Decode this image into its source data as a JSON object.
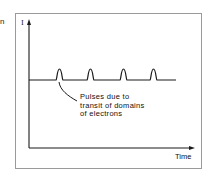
{
  "fragment_text": "n",
  "diagram": {
    "y_axis_label": "I",
    "x_axis_label": "Time",
    "annotation": {
      "lines": [
        "Pulses due to",
        "transit of domains",
        "of electrons"
      ]
    },
    "signal": {
      "description": "constant current baseline with periodic pulses",
      "pulse_count": 4
    }
  },
  "colors": {
    "line": "#1a1a1a",
    "frame": "#9a9a9a",
    "background": "#ffffff"
  }
}
